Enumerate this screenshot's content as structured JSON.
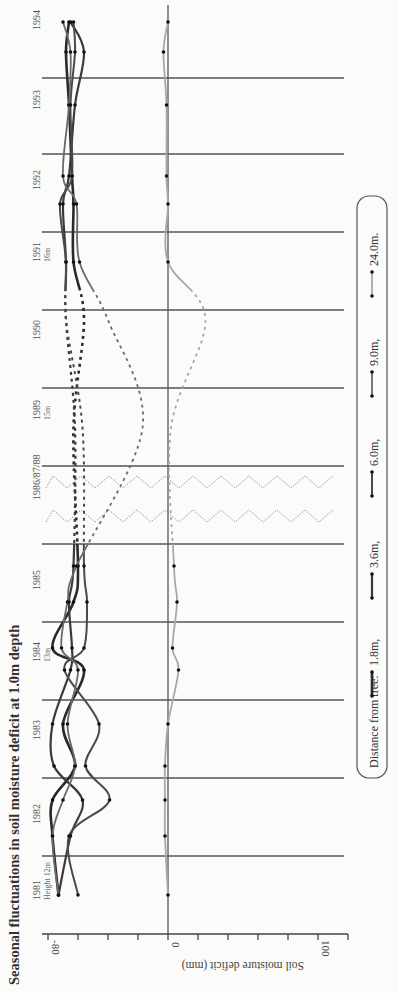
{
  "title": "Seasonal fluctuations in soil moisture deficit at 1.0m depth",
  "axis": {
    "label": "Soil moisture deficit (mm)",
    "tick_labels": [
      "-80",
      "0",
      "100"
    ]
  },
  "years": [
    {
      "label": "1981",
      "sub": "Height 12m"
    },
    {
      "label": "1982",
      "sub": ""
    },
    {
      "label": "1983",
      "sub": ""
    },
    {
      "label": "1984",
      "sub": "13m"
    },
    {
      "label": "1985",
      "sub": ""
    },
    {
      "label": "1986/87/88",
      "sub": ""
    },
    {
      "label": "1989",
      "sub": "15m"
    },
    {
      "label": "1990",
      "sub": ""
    },
    {
      "label": "1991",
      "sub": "16m"
    },
    {
      "label": "1992",
      "sub": ""
    },
    {
      "label": "1993",
      "sub": ""
    },
    {
      "label": "1994",
      "sub": ""
    }
  ],
  "legend": {
    "title": "Distance from tree:",
    "items": [
      {
        "label": "1.8m,",
        "color": "#2a2a2a",
        "width": 2.6
      },
      {
        "label": "3.6m,",
        "color": "#3a3a3a",
        "width": 2.2
      },
      {
        "label": "6.0m,",
        "color": "#4a4a4a",
        "width": 2.0
      },
      {
        "label": "9.0m,",
        "color": "#6a6a6a",
        "width": 1.8
      },
      {
        "label": "24.0m.",
        "color": "#a8a8a8",
        "width": 1.8
      }
    ]
  },
  "chart_data": {
    "type": "line",
    "title": "Seasonal fluctuations in soil moisture deficit at 1.0m depth",
    "xlabel": "Year",
    "ylabel": "Soil moisture deficit (mm)",
    "orientation": "rotated 90deg counter-clockwise (time runs bottom-to-top, deficit axis horizontal)",
    "ylim": [
      -85,
      120
    ],
    "y_ticks": [
      -80,
      -60,
      -40,
      -20,
      0,
      20,
      40,
      60,
      80,
      100,
      120
    ],
    "y_tick_labels_shown": [
      "-80",
      "0",
      "100"
    ],
    "grid": "year separator lines",
    "legend_position": "right (bottom of rotated figure)",
    "tree_heights": {
      "1981": "12m",
      "1984": "13m",
      "1989": "15m",
      "1991": "16m"
    },
    "categories": [
      "1981a",
      "1981b",
      "1982a",
      "1982b",
      "1983a",
      "1983b",
      "1984a",
      "1984b",
      "1985",
      "1989",
      "1991",
      "1992a",
      "1992b",
      "1993a",
      "1993b",
      "1994a",
      "1994b"
    ],
    "note": "Values sampled at plotted markers; 1986-88 and parts of 1985-91 are dashed (interpolated) in the original.",
    "series": [
      {
        "name": "1.8m",
        "values": [
          -73,
          -77,
          -77,
          -62,
          -70,
          -56,
          -77,
          -63,
          -60,
          -63,
          -56,
          -63,
          -63,
          -64,
          -66,
          -68,
          -66
        ]
      },
      {
        "name": "3.6m",
        "values": [
          -73,
          -65,
          -57,
          -76,
          -77,
          -65,
          -64,
          -66,
          -63,
          -62,
          -68,
          -68,
          -70,
          -66,
          -62,
          -56,
          -65
        ]
      },
      {
        "name": "6.0m",
        "values": [
          -60,
          -66,
          -39,
          -55,
          -46,
          -69,
          -56,
          -54,
          -56,
          -57,
          -68,
          -68,
          -72,
          -64,
          -65,
          -62,
          -63
        ]
      },
      {
        "name": "9.0m",
        "values": [
          -73,
          -77,
          -70,
          -62,
          -67,
          -60,
          -71,
          -67,
          -61,
          -17,
          -40,
          -59,
          -61,
          -70,
          -66,
          -65,
          -70
        ]
      },
      {
        "name": "24.0m",
        "values": [
          0,
          -2,
          -2,
          -2,
          0,
          7,
          3,
          6,
          4,
          2,
          25,
          0,
          0,
          -1,
          -1,
          -3,
          0
        ]
      }
    ]
  }
}
